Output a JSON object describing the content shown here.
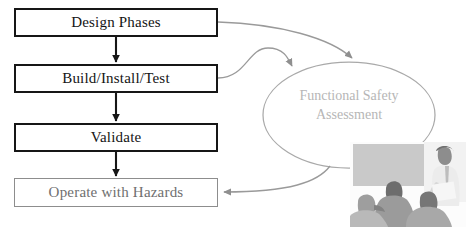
{
  "diagram": {
    "background_color": "#ffffff",
    "stroke_strong_color": "#161616",
    "stroke_muted_color": "#8d8d8d",
    "text_strong_color": "#141414",
    "text_muted_color": "#6f6f6f",
    "ellipse_text_color": "#b6b6b6"
  },
  "process_boxes": [
    {
      "id": "design-phases",
      "label": "Design Phases",
      "style": "strong",
      "x": 14,
      "y": 8,
      "w": 204,
      "h": 29
    },
    {
      "id": "build-install-test",
      "label": "Build/Install/Test",
      "style": "strong",
      "x": 14,
      "y": 64,
      "w": 204,
      "h": 29
    },
    {
      "id": "validate",
      "label": "Validate",
      "style": "strong",
      "x": 14,
      "y": 123,
      "w": 204,
      "h": 29
    },
    {
      "id": "operate-hazards",
      "label": "Operate with Hazards",
      "style": "muted",
      "x": 14,
      "y": 178,
      "w": 204,
      "h": 29
    }
  ],
  "ellipse": {
    "id": "functional-safety-assessment",
    "label_line_1": "Functional Safety",
    "label_line_2": "Assessment",
    "cx": 349,
    "cy": 115,
    "rx": 86,
    "ry": 53,
    "stroke": "#a9a9a9"
  },
  "flow_arrows": [
    {
      "id": "design-to-build",
      "from": "design-phases",
      "to": "build-install-test",
      "kind": "vertical",
      "color": "#161616"
    },
    {
      "id": "build-to-validate",
      "from": "build-install-test",
      "to": "validate",
      "kind": "vertical",
      "color": "#161616"
    },
    {
      "id": "validate-to-operate",
      "from": "validate",
      "to": "operate-hazards",
      "kind": "vertical",
      "color": "#161616"
    }
  ],
  "assessment_arrows": [
    {
      "id": "design-to-assessment",
      "from": "design-phases",
      "to": "functional-safety-assessment",
      "kind": "curve",
      "color": "#9a9a9a"
    },
    {
      "id": "build-to-assessment",
      "from": "build-install-test",
      "to": "functional-safety-assessment",
      "kind": "curve",
      "color": "#9a9a9a"
    },
    {
      "id": "assessment-to-operate",
      "from": "functional-safety-assessment",
      "to": "operate-hazards",
      "kind": "curve",
      "color": "#9a9a9a"
    }
  ],
  "photo": {
    "id": "assessment-meeting-photo",
    "description": "Grayscale photo of a presenter standing beside a screen addressing a seated audience",
    "x": 350,
    "y": 142,
    "w": 116,
    "h": 85
  }
}
